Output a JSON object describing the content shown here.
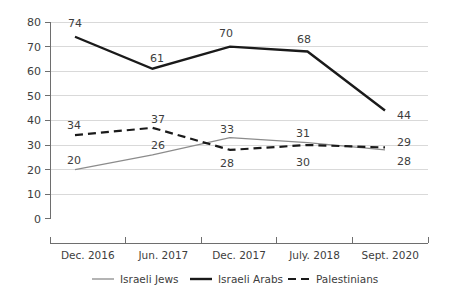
{
  "chart_data": {
    "type": "line",
    "title": "",
    "subtitle": "",
    "xlabel": "",
    "ylabel": "",
    "categories": [
      "Dec. 2016",
      "Jun. 2017",
      "Dec. 2017",
      "July. 2018",
      "Sept. 2020"
    ],
    "ylim": [
      0,
      80
    ],
    "yticks": [
      0,
      10,
      20,
      30,
      40,
      50,
      60,
      70,
      80
    ],
    "ytick_labels": [
      "0",
      "10",
      "20",
      "30",
      "40",
      "50",
      "60",
      "70",
      "80"
    ],
    "grid": true,
    "legend_position": "bottom",
    "series": [
      {
        "name": "Israeli Jews",
        "values": [
          20,
          26,
          33,
          31,
          28
        ],
        "value_labels": [
          "20",
          "26",
          "33",
          "31",
          "28"
        ],
        "color": "#8c8c8c",
        "style": "solid",
        "width": 1.3
      },
      {
        "name": "Israeli Arabs",
        "values": [
          74,
          61,
          70,
          68,
          44
        ],
        "value_labels": [
          "74",
          "61",
          "70",
          "68",
          "44"
        ],
        "color": "#1a1a1a",
        "style": "solid",
        "width": 2.4
      },
      {
        "name": "Palestinians",
        "values": [
          34,
          37,
          28,
          30,
          29
        ],
        "value_labels": [
          "34",
          "37",
          "28",
          "30",
          "29"
        ],
        "color": "#1a1a1a",
        "style": "dashed",
        "width": 2.2
      }
    ]
  },
  "axis": {
    "y_tick_0": "0",
    "y_tick_10": "10",
    "y_tick_20": "20",
    "y_tick_30": "30",
    "y_tick_40": "40",
    "y_tick_50": "50",
    "y_tick_60": "60",
    "y_tick_70": "70",
    "y_tick_80": "80"
  },
  "categories": {
    "c0": "Dec. 2016",
    "c1": "Jun. 2017",
    "c2": "Dec. 2017",
    "c3": "July. 2018",
    "c4": "Sept. 2020"
  },
  "labels": {
    "jews": {
      "p0": "20",
      "p1": "26",
      "p2": "33",
      "p3": "31",
      "p4": "28"
    },
    "arabs": {
      "p0": "74",
      "p1": "61",
      "p2": "70",
      "p3": "68",
      "p4": "44"
    },
    "pal": {
      "p0": "34",
      "p1": "37",
      "p2": "28",
      "p3": "30",
      "p4": "29"
    }
  },
  "legend": {
    "item0": "Israeli Jews",
    "item1": "Israeli Arabs",
    "item2": "Palestinians"
  },
  "colors": {
    "jews": "#8c8c8c",
    "arabs": "#1a1a1a",
    "palestinians": "#1a1a1a",
    "grid": "#d9d9d9",
    "axis": "#6e6e6e",
    "text": "#3d3d3d",
    "background": "#ffffff"
  }
}
